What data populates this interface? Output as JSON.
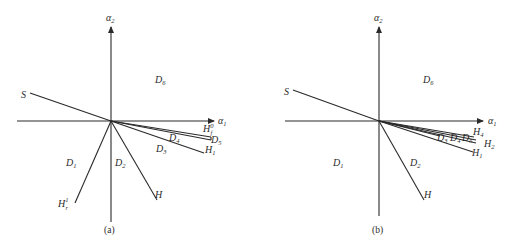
{
  "panels": [
    {
      "caption": "(a)",
      "axes": {
        "x_label": "α",
        "x_sub": "1",
        "y_label": "α",
        "y_sub": "2"
      },
      "lines": {
        "S": {
          "label": "S"
        },
        "Hr1": {
          "label": "H",
          "sup": "1",
          "sub": "r"
        },
        "H": {
          "label": "H"
        },
        "H1": {
          "label": "H",
          "sub": "1"
        },
        "Hf0": {
          "label": "H",
          "sup": "0",
          "sub": "f"
        }
      },
      "regions": {
        "D1": {
          "label": "D",
          "sub": "1"
        },
        "D2": {
          "label": "D",
          "sub": "2"
        },
        "D3": {
          "label": "D",
          "sub": "3"
        },
        "D4": {
          "label": "D",
          "sub": "4"
        },
        "D5": {
          "label": "D",
          "sub": "5"
        },
        "D6": {
          "label": "D",
          "sub": "6"
        }
      }
    },
    {
      "caption": "(b)",
      "axes": {
        "x_label": "α",
        "x_sub": "1",
        "y_label": "α",
        "y_sub": "2"
      },
      "lines": {
        "S": {
          "label": "S"
        },
        "H": {
          "label": "H"
        },
        "H1": {
          "label": "H",
          "sub": "1"
        },
        "H2": {
          "label": "H",
          "sub": "2"
        },
        "H4": {
          "label": "H",
          "sub": "4"
        }
      },
      "regions": {
        "D1": {
          "label": "D",
          "sub": "1"
        },
        "D2": {
          "label": "D",
          "sub": "2"
        },
        "D3": {
          "label": "D",
          "sub": "3"
        },
        "D4": {
          "label": "D",
          "sub": "4"
        },
        "D5": {
          "label": "D",
          "sub": "5"
        },
        "D6": {
          "label": "D",
          "sub": "6"
        }
      }
    }
  ],
  "colors": {
    "ink": "#2a2a2a",
    "background": "#ffffff"
  }
}
